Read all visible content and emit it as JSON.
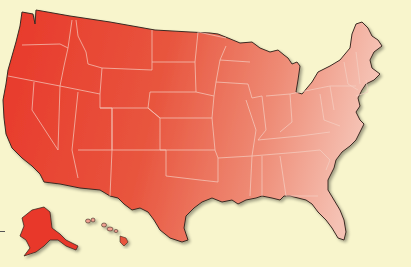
{
  "map": {
    "subject": "United States of America",
    "style": "choropleth-gradient",
    "colors": {
      "background": "#f8f5cc",
      "west": "#e8382a",
      "east": "#f2b4a6",
      "border": "#f5d0c4",
      "outline": "#3a2a22"
    },
    "regions": [
      "contiguous-us",
      "alaska",
      "hawaii"
    ],
    "labels": []
  }
}
